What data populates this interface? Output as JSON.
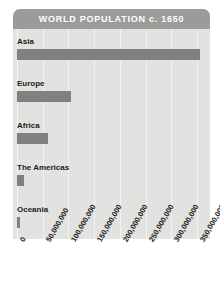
{
  "chart_data": {
    "type": "bar",
    "orientation": "horizontal",
    "title": "WORLD POPULATION c. 1650",
    "xlabel": "",
    "ylabel": "",
    "categories": [
      "Asia",
      "Europe",
      "Africa",
      "The Americas",
      "Oceania"
    ],
    "values": [
      355000000,
      105000000,
      60000000,
      13000000,
      5000000
    ],
    "xlim": [
      0,
      375000000
    ],
    "xticks": [
      0,
      50000000,
      100000000,
      150000000,
      200000000,
      250000000,
      300000000,
      350000000
    ],
    "xtick_labels": [
      "0",
      "50,000,000",
      "100,000,000",
      "150,000,000",
      "200,000,000",
      "250,000,000",
      "300,000,000",
      "350,000,000"
    ],
    "grid": true,
    "legend": false,
    "colors": {
      "bar": "#80807f",
      "title_banner": "#9b9b9a",
      "title_text": "#ffffff",
      "plot_background": "#e2e2e0",
      "gridline": "#f2f2f1",
      "label_text": "#1c1c1c",
      "page_background": "#ffffff"
    }
  },
  "chart": {
    "title": "WORLD POPULATION c. 1650",
    "bars": [
      {
        "label": "Asia",
        "value": 355000000
      },
      {
        "label": "Europe",
        "value": 105000000
      },
      {
        "label": "Africa",
        "value": 60000000
      },
      {
        "label": "The Americas",
        "value": 13000000
      },
      {
        "label": "Oceania",
        "value": 5000000
      }
    ],
    "ticks": [
      {
        "label": "0",
        "value": 0
      },
      {
        "label": "50,000,000",
        "value": 50000000
      },
      {
        "label": "100,000,000",
        "value": 100000000
      },
      {
        "label": "150,000,000",
        "value": 150000000
      },
      {
        "label": "200,000,000",
        "value": 200000000
      },
      {
        "label": "250,000,000",
        "value": 250000000
      },
      {
        "label": "300,000,000",
        "value": 300000000
      },
      {
        "label": "350,000,000",
        "value": 350000000
      }
    ]
  }
}
